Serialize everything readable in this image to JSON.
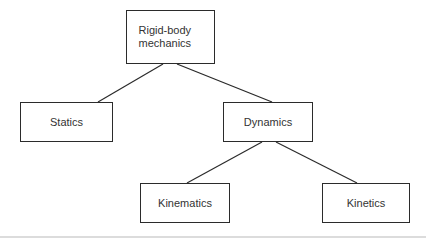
{
  "diagram": {
    "type": "tree",
    "nodes": [
      {
        "id": "root",
        "label": "Rigid-body mechanics"
      },
      {
        "id": "statics",
        "label": "Statics"
      },
      {
        "id": "dynamics",
        "label": "Dynamics"
      },
      {
        "id": "kinematics",
        "label": "Kinematics"
      },
      {
        "id": "kinetics",
        "label": "Kinetics"
      }
    ],
    "edges": [
      {
        "from": "root",
        "to": "statics"
      },
      {
        "from": "root",
        "to": "dynamics"
      },
      {
        "from": "dynamics",
        "to": "kinematics"
      },
      {
        "from": "dynamics",
        "to": "kinetics"
      }
    ],
    "colors": {
      "box_border": "#2b2b2b",
      "box_fill": "#ffffff",
      "connector": "#2b2b2b",
      "text": "#333333",
      "bottom_rule": "#dcdcdc",
      "background": "#ffffff"
    }
  }
}
